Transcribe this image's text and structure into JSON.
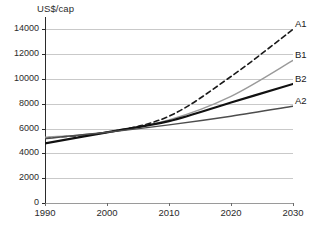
{
  "chart_data": {
    "type": "line",
    "title": "",
    "xlabel": "",
    "ylabel": "US$/cap",
    "x": [
      1990,
      2000,
      2010,
      2020,
      2030
    ],
    "xlim": [
      1990,
      2030
    ],
    "ylim": [
      0,
      15000
    ],
    "xticks": [
      "1990",
      "2000",
      "2010",
      "2020",
      "2030"
    ],
    "yticks": [
      "0",
      "2000",
      "4000",
      "6000",
      "8000",
      "10000",
      "12000",
      "14000"
    ],
    "ytick_values": [
      0,
      2000,
      4000,
      6000,
      8000,
      10000,
      12000,
      14000
    ],
    "grid": "horizontal",
    "legend": "inline-right-endpoint",
    "series": [
      {
        "name": "A1",
        "values": [
          5250,
          5700,
          7000,
          10200,
          14000
        ],
        "color": "#1a1a1a",
        "style": "dashed",
        "width": 1.6
      },
      {
        "name": "B1",
        "values": [
          5300,
          5700,
          6700,
          8600,
          11500
        ],
        "color": "#9a9a9a",
        "style": "solid",
        "width": 1.4
      },
      {
        "name": "B2",
        "values": [
          4800,
          5700,
          6600,
          8100,
          9600
        ],
        "color": "#111111",
        "style": "solid",
        "width": 2.2
      },
      {
        "name": "A2",
        "values": [
          5200,
          5700,
          6300,
          7000,
          7800
        ],
        "color": "#4d4d4d",
        "style": "solid",
        "width": 1.5
      }
    ]
  },
  "axis": {
    "y_unit_label": "US$/cap"
  },
  "caption": {
    "text": ""
  }
}
